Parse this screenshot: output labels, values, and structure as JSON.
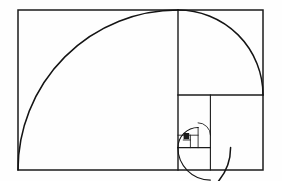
{
  "figure": {
    "title": "Fibonacci Golden Spiral",
    "background_color": "#fefefe",
    "stroke_color": "#1b1b1b",
    "arc_color": "#141414"
  },
  "chart_data": {
    "type": "diagram",
    "title": "Fibonacci Golden Spiral",
    "subtitle": "",
    "xlabel": "",
    "ylabel": "",
    "grid": false,
    "legend": null,
    "annotations": [],
    "canvas": {
      "width": 282,
      "height": 181
    },
    "outer_rectangle": {
      "x": 18,
      "y": 10,
      "width": 245,
      "height": 160,
      "ratio_label": "1.618"
    },
    "fibonacci_sequence": [
      1,
      1,
      2,
      3,
      5,
      8,
      13,
      21
    ],
    "squares": [
      {
        "index": 0,
        "fib": 13,
        "x": 18,
        "y": 10,
        "size": 160,
        "corner": "bottom-left"
      },
      {
        "index": 1,
        "fib": 8,
        "x": 178,
        "y": 10,
        "size": 85,
        "corner": "top-left"
      },
      {
        "index": 2,
        "fib": 5,
        "x": 178,
        "y": 95,
        "size": 52.6,
        "corner": "top-right"
      },
      {
        "index": 3,
        "fib": 3,
        "x": 210.4,
        "y": 147.6,
        "size": 32.5,
        "corner": "bottom-right"
      },
      {
        "index": 4,
        "fib": 2,
        "x": 178,
        "y": 147.6,
        "size": 20.1,
        "corner": "bottom-left"
      },
      {
        "index": 5,
        "fib": 1,
        "x": 178,
        "y": 135.2,
        "size": 12.4,
        "corner": "top-left"
      },
      {
        "index": 6,
        "fib": 1,
        "x": 190.4,
        "y": 135.2,
        "size": 7.7,
        "corner": "top-right"
      }
    ],
    "arcs": [
      {
        "index": 0,
        "fib": 13,
        "center_x": 178,
        "center_y": 170,
        "radius": 160,
        "start_deg": 180,
        "end_deg": 270
      },
      {
        "index": 1,
        "fib": 8,
        "center_x": 178,
        "center_y": 95,
        "radius": 85,
        "start_deg": 270,
        "end_deg": 360
      },
      {
        "index": 2,
        "fib": 5,
        "center_x": 178,
        "center_y": 147.6,
        "radius": 52.6,
        "start_deg": 0,
        "end_deg": 90
      },
      {
        "index": 3,
        "fib": 3,
        "center_x": 210.4,
        "center_y": 147.6,
        "radius": 32.5,
        "start_deg": 90,
        "end_deg": 180
      },
      {
        "index": 4,
        "fib": 2,
        "center_x": 198.1,
        "center_y": 147.6,
        "radius": 20.1,
        "start_deg": 180,
        "end_deg": 270
      },
      {
        "index": 5,
        "fib": 1,
        "center_x": 198.1,
        "center_y": 135.2,
        "radius": 12.4,
        "start_deg": 270,
        "end_deg": 360
      }
    ],
    "filled_block": {
      "x": 183.6,
      "y": 133.0,
      "width": 5.6,
      "height": 6.2
    }
  }
}
